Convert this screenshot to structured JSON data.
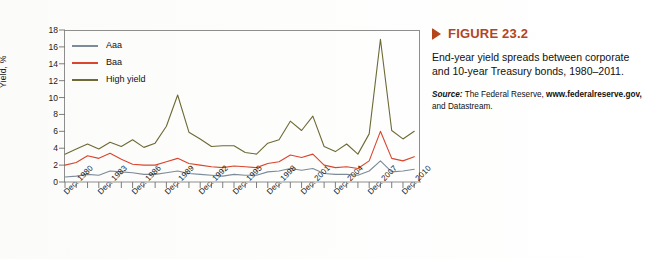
{
  "figure": {
    "marker_icon": "triangle-right-icon",
    "title": "FIGURE 23.2",
    "description": "End-year yield spreads between corporate and 10-year Treasury bonds, 1980–2011.",
    "source_label": "Source:",
    "source_text_1": "The Federal Reserve,",
    "source_url": "www.federalreserve.gov,",
    "source_text_2": "and Datastream.",
    "accent_color": "#b5451b"
  },
  "chart_data": {
    "type": "line",
    "title": "",
    "xlabel": "",
    "ylabel": "Yield, %",
    "ylim": [
      0,
      18
    ],
    "yticks": [
      0,
      2,
      4,
      6,
      8,
      10,
      12,
      14,
      16,
      18
    ],
    "grid": false,
    "legend_position": "top-left",
    "x": [
      "Dec. 1980",
      "Dec. 1981",
      "Dec. 1982",
      "Dec. 1983",
      "Dec. 1984",
      "Dec. 1985",
      "Dec. 1986",
      "Dec. 1987",
      "Dec. 1988",
      "Dec. 1989",
      "Dec. 1990",
      "Dec. 1991",
      "Dec. 1992",
      "Dec. 1993",
      "Dec. 1994",
      "Dec. 1995",
      "Dec. 1996",
      "Dec. 1997",
      "Dec. 1998",
      "Dec. 1999",
      "Dec. 2000",
      "Dec. 2001",
      "Dec. 2002",
      "Dec. 2003",
      "Dec. 2004",
      "Dec. 2005",
      "Dec. 2006",
      "Dec. 2007",
      "Dec. 2008",
      "Dec. 2009",
      "Dec. 2010",
      "Dec. 2011"
    ],
    "xtick_labels": [
      "Dec. 1980",
      "Dec. 1983",
      "Dec. 1986",
      "Dec. 1989",
      "Dec. 1992",
      "Dec. 1995",
      "Dec. 1998",
      "Dec. 2001",
      "Dec. 2004",
      "Dec. 2007",
      "Dec. 2010"
    ],
    "xtick_indices": [
      0,
      3,
      6,
      9,
      12,
      15,
      18,
      21,
      24,
      27,
      30
    ],
    "series": [
      {
        "name": "Aaa",
        "color": "#7c8a99",
        "values": [
          0.6,
          0.7,
          0.9,
          0.8,
          1.3,
          1.2,
          1.1,
          0.9,
          0.9,
          1.1,
          1.3,
          1.0,
          0.9,
          0.8,
          0.7,
          0.9,
          0.8,
          0.8,
          1.2,
          1.3,
          1.6,
          1.4,
          1.6,
          1.0,
          0.9,
          0.9,
          0.8,
          1.3,
          2.5,
          1.2,
          1.3,
          1.5
        ]
      },
      {
        "name": "Baa",
        "color": "#d9452f",
        "values": [
          2.0,
          2.3,
          3.1,
          2.8,
          3.4,
          2.7,
          2.1,
          2.0,
          2.0,
          2.4,
          2.8,
          2.2,
          2.0,
          1.8,
          1.7,
          1.9,
          1.8,
          1.7,
          2.2,
          2.4,
          3.2,
          2.9,
          3.3,
          2.0,
          1.7,
          1.8,
          1.6,
          2.5,
          6.0,
          2.8,
          2.5,
          3.0
        ]
      },
      {
        "name": "High yield",
        "color": "#6d6a35",
        "values": [
          3.3,
          3.9,
          4.5,
          3.9,
          4.7,
          4.2,
          5.0,
          4.1,
          4.6,
          6.6,
          10.3,
          5.9,
          5.1,
          4.2,
          4.3,
          4.3,
          3.5,
          3.3,
          4.6,
          5.0,
          7.2,
          6.1,
          7.8,
          4.2,
          3.6,
          4.5,
          3.3,
          5.7,
          16.9,
          6.1,
          5.1,
          6.0
        ]
      }
    ]
  }
}
